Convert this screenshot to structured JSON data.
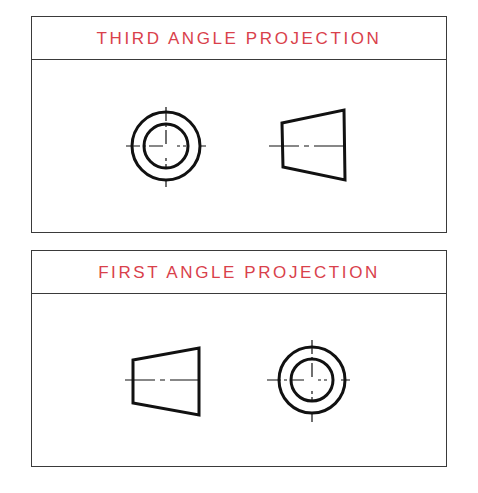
{
  "panels": [
    {
      "title": "THIRD ANGLE PROJECTION",
      "order": [
        "circle-end-view",
        "frustum-side-view"
      ]
    },
    {
      "title": "FIRST ANGLE PROJECTION",
      "order": [
        "frustum-side-view",
        "circle-end-view"
      ]
    }
  ],
  "colors": {
    "title": "#d9414b",
    "line": "#111111",
    "border": "#3a3a3a"
  }
}
